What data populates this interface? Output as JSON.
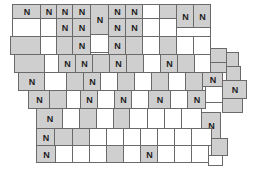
{
  "map": {
    "title": "Iowa counties",
    "shade_color": "#cfcfcf",
    "border_color": "#6a6a6a",
    "label_text": "N",
    "counties": [
      {
        "x": 12,
        "y": 4,
        "w": 28,
        "h": 14,
        "s": 1,
        "n": 1
      },
      {
        "x": 40,
        "y": 4,
        "w": 16,
        "h": 14,
        "s": 1,
        "n": 1
      },
      {
        "x": 56,
        "y": 4,
        "w": 16,
        "h": 14,
        "s": 1,
        "n": 1
      },
      {
        "x": 72,
        "y": 4,
        "w": 18,
        "h": 14,
        "s": 1,
        "n": 1
      },
      {
        "x": 90,
        "y": 4,
        "w": 18,
        "h": 30,
        "s": 1,
        "n": 1
      },
      {
        "x": 108,
        "y": 4,
        "w": 17,
        "h": 14,
        "s": 1,
        "n": 1
      },
      {
        "x": 125,
        "y": 4,
        "w": 17,
        "h": 14,
        "s": 1,
        "n": 1
      },
      {
        "x": 142,
        "y": 4,
        "w": 17,
        "h": 14,
        "s": 0,
        "n": 0
      },
      {
        "x": 159,
        "y": 4,
        "w": 17,
        "h": 14,
        "s": 1,
        "n": 0
      },
      {
        "x": 176,
        "y": 4,
        "w": 17,
        "h": 23,
        "s": 1,
        "n": 1
      },
      {
        "x": 193,
        "y": 4,
        "w": 17,
        "h": 23,
        "s": 1,
        "n": 1
      },
      {
        "x": 12,
        "y": 18,
        "w": 28,
        "h": 18,
        "s": 0,
        "n": 0
      },
      {
        "x": 40,
        "y": 18,
        "w": 16,
        "h": 18,
        "s": 0,
        "n": 0
      },
      {
        "x": 56,
        "y": 18,
        "w": 16,
        "h": 18,
        "s": 1,
        "n": 1
      },
      {
        "x": 72,
        "y": 18,
        "w": 18,
        "h": 18,
        "s": 1,
        "n": 1
      },
      {
        "x": 108,
        "y": 18,
        "w": 17,
        "h": 18,
        "s": 1,
        "n": 1
      },
      {
        "x": 125,
        "y": 18,
        "w": 17,
        "h": 18,
        "s": 1,
        "n": 1
      },
      {
        "x": 142,
        "y": 18,
        "w": 17,
        "h": 18,
        "s": 0,
        "n": 0
      },
      {
        "x": 159,
        "y": 18,
        "w": 17,
        "h": 18,
        "s": 0,
        "n": 0
      },
      {
        "x": 176,
        "y": 27,
        "w": 34,
        "h": 9,
        "s": 0,
        "n": 0
      },
      {
        "x": 10,
        "y": 36,
        "w": 30,
        "h": 18,
        "s": 1,
        "n": 0
      },
      {
        "x": 40,
        "y": 36,
        "w": 16,
        "h": 18,
        "s": 0,
        "n": 0
      },
      {
        "x": 56,
        "y": 36,
        "w": 16,
        "h": 18,
        "s": 1,
        "n": 0
      },
      {
        "x": 72,
        "y": 36,
        "w": 18,
        "h": 18,
        "s": 1,
        "n": 1
      },
      {
        "x": 90,
        "y": 34,
        "w": 18,
        "h": 18,
        "s": 0,
        "n": 0
      },
      {
        "x": 108,
        "y": 36,
        "w": 17,
        "h": 18,
        "s": 1,
        "n": 1
      },
      {
        "x": 125,
        "y": 36,
        "w": 17,
        "h": 18,
        "s": 1,
        "n": 0
      },
      {
        "x": 142,
        "y": 36,
        "w": 17,
        "h": 18,
        "s": 0,
        "n": 0
      },
      {
        "x": 159,
        "y": 36,
        "w": 17,
        "h": 18,
        "s": 1,
        "n": 0
      },
      {
        "x": 176,
        "y": 36,
        "w": 17,
        "h": 18,
        "s": 0,
        "n": 0
      },
      {
        "x": 193,
        "y": 36,
        "w": 17,
        "h": 18,
        "s": 0,
        "n": 0
      },
      {
        "x": 210,
        "y": 48,
        "w": 16,
        "h": 14,
        "s": 1,
        "n": 0
      },
      {
        "x": 226,
        "y": 52,
        "w": 12,
        "h": 14,
        "s": 1,
        "n": 0
      },
      {
        "x": 14,
        "y": 54,
        "w": 30,
        "h": 18,
        "s": 1,
        "n": 0
      },
      {
        "x": 44,
        "y": 54,
        "w": 14,
        "h": 18,
        "s": 0,
        "n": 0
      },
      {
        "x": 58,
        "y": 54,
        "w": 17,
        "h": 18,
        "s": 1,
        "n": 1
      },
      {
        "x": 75,
        "y": 54,
        "w": 17,
        "h": 18,
        "s": 1,
        "n": 1
      },
      {
        "x": 92,
        "y": 54,
        "w": 17,
        "h": 18,
        "s": 1,
        "n": 0
      },
      {
        "x": 109,
        "y": 54,
        "w": 17,
        "h": 18,
        "s": 1,
        "n": 1
      },
      {
        "x": 126,
        "y": 54,
        "w": 17,
        "h": 18,
        "s": 1,
        "n": 0
      },
      {
        "x": 143,
        "y": 54,
        "w": 17,
        "h": 18,
        "s": 0,
        "n": 0
      },
      {
        "x": 160,
        "y": 54,
        "w": 17,
        "h": 18,
        "s": 1,
        "n": 1
      },
      {
        "x": 177,
        "y": 54,
        "w": 17,
        "h": 18,
        "s": 1,
        "n": 0
      },
      {
        "x": 194,
        "y": 54,
        "w": 16,
        "h": 18,
        "s": 0,
        "n": 0
      },
      {
        "x": 210,
        "y": 62,
        "w": 16,
        "h": 10,
        "s": 1,
        "n": 0
      },
      {
        "x": 226,
        "y": 66,
        "w": 14,
        "h": 14,
        "s": 1,
        "n": 0
      },
      {
        "x": 18,
        "y": 72,
        "w": 26,
        "h": 18,
        "s": 1,
        "n": 1
      },
      {
        "x": 44,
        "y": 72,
        "w": 22,
        "h": 18,
        "s": 0,
        "n": 0
      },
      {
        "x": 66,
        "y": 72,
        "w": 17,
        "h": 18,
        "s": 1,
        "n": 0
      },
      {
        "x": 83,
        "y": 72,
        "w": 17,
        "h": 18,
        "s": 1,
        "n": 1
      },
      {
        "x": 100,
        "y": 72,
        "w": 17,
        "h": 18,
        "s": 0,
        "n": 0
      },
      {
        "x": 117,
        "y": 72,
        "w": 17,
        "h": 18,
        "s": 1,
        "n": 0
      },
      {
        "x": 134,
        "y": 72,
        "w": 17,
        "h": 18,
        "s": 0,
        "n": 0
      },
      {
        "x": 151,
        "y": 72,
        "w": 17,
        "h": 18,
        "s": 1,
        "n": 0
      },
      {
        "x": 168,
        "y": 72,
        "w": 17,
        "h": 18,
        "s": 0,
        "n": 0
      },
      {
        "x": 185,
        "y": 72,
        "w": 17,
        "h": 18,
        "s": 1,
        "n": 0
      },
      {
        "x": 202,
        "y": 72,
        "w": 20,
        "h": 14,
        "s": 1,
        "n": 1
      },
      {
        "x": 222,
        "y": 80,
        "w": 24,
        "h": 18,
        "s": 1,
        "n": 1
      },
      {
        "x": 28,
        "y": 90,
        "w": 21,
        "h": 18,
        "s": 1,
        "n": 1
      },
      {
        "x": 49,
        "y": 90,
        "w": 17,
        "h": 18,
        "s": 1,
        "n": 0
      },
      {
        "x": 66,
        "y": 90,
        "w": 14,
        "h": 18,
        "s": 0,
        "n": 0
      },
      {
        "x": 80,
        "y": 90,
        "w": 17,
        "h": 18,
        "s": 1,
        "n": 1
      },
      {
        "x": 97,
        "y": 90,
        "w": 17,
        "h": 18,
        "s": 0,
        "n": 0
      },
      {
        "x": 114,
        "y": 90,
        "w": 17,
        "h": 18,
        "s": 1,
        "n": 1
      },
      {
        "x": 131,
        "y": 90,
        "w": 17,
        "h": 18,
        "s": 0,
        "n": 0
      },
      {
        "x": 148,
        "y": 90,
        "w": 22,
        "h": 18,
        "s": 1,
        "n": 1
      },
      {
        "x": 170,
        "y": 90,
        "w": 17,
        "h": 18,
        "s": 0,
        "n": 0
      },
      {
        "x": 187,
        "y": 90,
        "w": 18,
        "h": 18,
        "s": 1,
        "n": 1
      },
      {
        "x": 205,
        "y": 86,
        "w": 17,
        "h": 16,
        "s": 0,
        "n": 0
      },
      {
        "x": 222,
        "y": 98,
        "w": 20,
        "h": 14,
        "s": 1,
        "n": 0
      },
      {
        "x": 36,
        "y": 108,
        "w": 26,
        "h": 20,
        "s": 1,
        "n": 1
      },
      {
        "x": 62,
        "y": 108,
        "w": 17,
        "h": 20,
        "s": 0,
        "n": 0
      },
      {
        "x": 79,
        "y": 108,
        "w": 17,
        "h": 20,
        "s": 1,
        "n": 0
      },
      {
        "x": 96,
        "y": 108,
        "w": 17,
        "h": 20,
        "s": 0,
        "n": 0
      },
      {
        "x": 113,
        "y": 108,
        "w": 16,
        "h": 20,
        "s": 1,
        "n": 0
      },
      {
        "x": 129,
        "y": 108,
        "w": 18,
        "h": 20,
        "s": 0,
        "n": 0
      },
      {
        "x": 147,
        "y": 108,
        "w": 17,
        "h": 20,
        "s": 0,
        "n": 0
      },
      {
        "x": 164,
        "y": 108,
        "w": 17,
        "h": 20,
        "s": 0,
        "n": 0
      },
      {
        "x": 181,
        "y": 108,
        "w": 20,
        "h": 20,
        "s": 0,
        "n": 0
      },
      {
        "x": 201,
        "y": 112,
        "w": 19,
        "h": 26,
        "s": 1,
        "n": 1
      },
      {
        "x": 36,
        "y": 128,
        "w": 18,
        "h": 17,
        "s": 1,
        "n": 1
      },
      {
        "x": 54,
        "y": 128,
        "w": 18,
        "h": 17,
        "s": 1,
        "n": 0
      },
      {
        "x": 72,
        "y": 128,
        "w": 17,
        "h": 17,
        "s": 1,
        "n": 0
      },
      {
        "x": 89,
        "y": 128,
        "w": 17,
        "h": 17,
        "s": 0,
        "n": 0
      },
      {
        "x": 106,
        "y": 128,
        "w": 17,
        "h": 17,
        "s": 0,
        "n": 0
      },
      {
        "x": 123,
        "y": 128,
        "w": 17,
        "h": 17,
        "s": 0,
        "n": 0
      },
      {
        "x": 140,
        "y": 128,
        "w": 17,
        "h": 17,
        "s": 0,
        "n": 0
      },
      {
        "x": 157,
        "y": 128,
        "w": 17,
        "h": 17,
        "s": 0,
        "n": 0
      },
      {
        "x": 174,
        "y": 128,
        "w": 17,
        "h": 17,
        "s": 0,
        "n": 0
      },
      {
        "x": 191,
        "y": 128,
        "w": 20,
        "h": 17,
        "s": 0,
        "n": 0
      },
      {
        "x": 211,
        "y": 138,
        "w": 16,
        "h": 17,
        "s": 1,
        "n": 0
      },
      {
        "x": 36,
        "y": 145,
        "w": 19,
        "h": 17,
        "s": 1,
        "n": 1
      },
      {
        "x": 55,
        "y": 145,
        "w": 17,
        "h": 17,
        "s": 0,
        "n": 0
      },
      {
        "x": 72,
        "y": 145,
        "w": 17,
        "h": 17,
        "s": 0,
        "n": 0
      },
      {
        "x": 89,
        "y": 145,
        "w": 17,
        "h": 17,
        "s": 0,
        "n": 0
      },
      {
        "x": 106,
        "y": 145,
        "w": 17,
        "h": 17,
        "s": 1,
        "n": 0
      },
      {
        "x": 123,
        "y": 145,
        "w": 17,
        "h": 17,
        "s": 0,
        "n": 0
      },
      {
        "x": 140,
        "y": 145,
        "w": 17,
        "h": 17,
        "s": 1,
        "n": 1
      },
      {
        "x": 157,
        "y": 145,
        "w": 17,
        "h": 17,
        "s": 0,
        "n": 0
      },
      {
        "x": 174,
        "y": 145,
        "w": 17,
        "h": 17,
        "s": 0,
        "n": 0
      },
      {
        "x": 191,
        "y": 145,
        "w": 17,
        "h": 17,
        "s": 0,
        "n": 0
      },
      {
        "x": 208,
        "y": 155,
        "w": 14,
        "h": 10,
        "s": 0,
        "n": 0
      }
    ]
  }
}
